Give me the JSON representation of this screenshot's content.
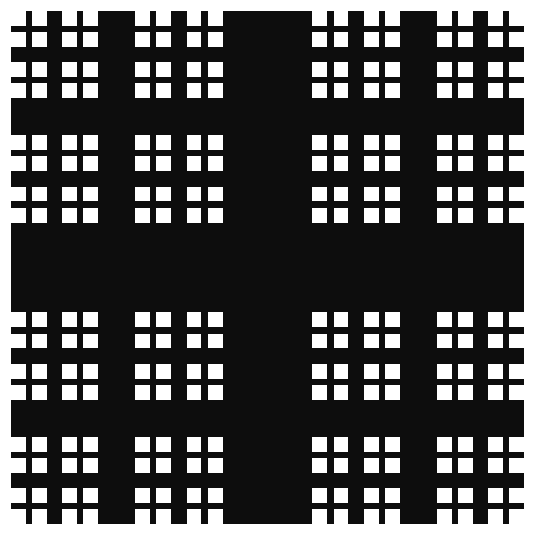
{
  "page": {
    "title": "Recursive Cross Fractal",
    "background_color": "#ffffff",
    "width": 536,
    "height": 544
  },
  "figure": {
    "name": "recursive-cross-fractal",
    "ink_color": "#0d0d0d",
    "paper_color": "#ffffff"
  },
  "chart_data": {
    "type": "heatmap",
    "title": "Recursive Cross Fractal",
    "subtitle": "",
    "xlabel": "",
    "ylabel": "",
    "grid": false,
    "legend_position": "none",
    "fractal": {
      "name": "cross-fractal",
      "family": "Vicsek / Sierpinski-carpet variant",
      "construction_rule": "Each square is split into a 3-band x 3-band grid. The middle horizontal band and middle vertical band are filled solid black forming a plus sign. The four corner squares are replaced by scaled copies of the whole figure.",
      "depth": 4,
      "branching_factor": 4,
      "bar_fraction": 0.175,
      "quadrant_fraction": 0.4125,
      "fill_color": "#0d0d0d",
      "background_color": "#ffffff",
      "bounds": {
        "x": 11,
        "y": 11,
        "width": 513,
        "height": 517
      },
      "level_bar_widths_px": [
        90,
        37,
        15,
        6
      ],
      "level_cell_sizes_px": [
        513,
        212,
        87,
        36
      ]
    },
    "categories": [
      "level-0",
      "level-1",
      "level-2",
      "level-3"
    ],
    "series": [
      {
        "name": "blocks per level",
        "values": [
          1,
          4,
          16,
          64
        ]
      },
      {
        "name": "cell size (px)",
        "values": [
          513,
          212,
          87,
          36
        ]
      },
      {
        "name": "bar width (px)",
        "values": [
          90,
          37,
          15,
          6
        ]
      }
    ],
    "xlim": [
      0,
      536
    ],
    "ylim": [
      0,
      544
    ]
  }
}
